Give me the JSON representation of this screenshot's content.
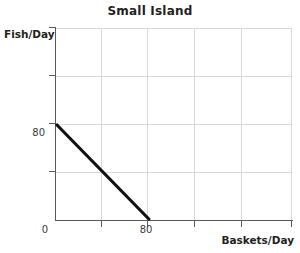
{
  "chart_data": {
    "type": "line",
    "title": "Small Island",
    "xlabel": "Baskets/Day",
    "ylabel": "Fish/Day",
    "xlim": [
      0,
      200
    ],
    "ylim": [
      0,
      160
    ],
    "grid": true,
    "legend": null,
    "x_tick_values": [
      0,
      80
    ],
    "y_tick_values": [
      80
    ],
    "x_tick_labels": [
      "0",
      "80"
    ],
    "y_tick_labels": [
      "80"
    ],
    "series": [
      {
        "name": "Production Possibilities Frontier",
        "color": "#111111",
        "x": [
          0,
          80
        ],
        "y": [
          80,
          0
        ]
      }
    ],
    "annotations": []
  },
  "axes": {
    "y_axis_title": "Fish/Day",
    "x_axis_title": "Baskets/Day"
  },
  "labels": {
    "y_tick_80": "80",
    "x_tick_0": "0",
    "x_tick_80": "80"
  },
  "colors": {
    "line": "#111111",
    "grid": "#d8d9dc",
    "axis": "#58595b",
    "text": "#231f20",
    "background": "#ffffff"
  }
}
